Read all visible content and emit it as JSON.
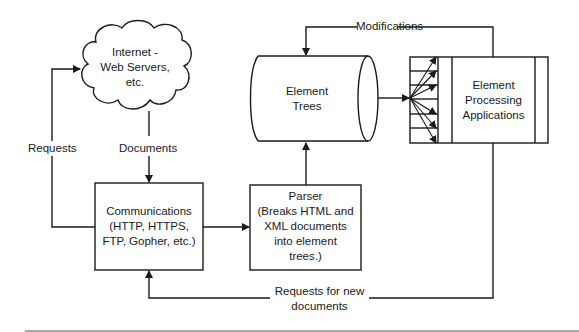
{
  "diagram": {
    "nodes": {
      "internet": {
        "lines": [
          "Internet -",
          "Web Servers,",
          "etc."
        ]
      },
      "communications": {
        "lines": [
          "Communications",
          "(HTTP, HTTPS,",
          "FTP, Gopher, etc.)"
        ]
      },
      "parser": {
        "lines": [
          "Parser",
          "(Breaks HTML and",
          "XML documents",
          "into element",
          "trees.)"
        ]
      },
      "element_trees": {
        "lines": [
          "Element",
          "Trees"
        ]
      },
      "processing": {
        "lines": [
          "Element",
          "Processing",
          "Applications"
        ]
      }
    },
    "edges": {
      "requests": "Requests",
      "documents": "Documents",
      "modifications": "Modifications",
      "requests_new": [
        "Requests for new",
        "documents"
      ]
    },
    "colors": {
      "stroke": "#1a1a1a",
      "background": "#ffffff"
    }
  }
}
